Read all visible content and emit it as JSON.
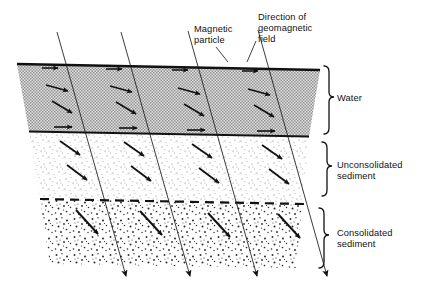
{
  "figure": {
    "type": "cross-section-diagram"
  },
  "callouts": [
    {
      "id": "magnetic-particle",
      "text": "Magnetic\nparticle"
    },
    {
      "id": "geomagnetic-field",
      "text": "Direction of\ngeomagnetic\nfield"
    }
  ],
  "layers": [
    {
      "id": "water",
      "label": "Water",
      "texture": "halftone-gray",
      "fill": "#b9b9b9",
      "particle_orientation": "random-to-aligning"
    },
    {
      "id": "unconsolidated-sediment",
      "label": "Unconsolidated\nsediment",
      "texture": "fine-stipple",
      "fill": "#f2f2f2",
      "particle_orientation": "aligned-with-field"
    },
    {
      "id": "consolidated-sediment",
      "label": "Consolidated\nsediment",
      "texture": "coarse-stipple",
      "fill": "#f6f6f6",
      "particle_orientation": "locked-aligned"
    }
  ],
  "field_lines": {
    "count": 4,
    "description": "Inclined geomagnetic field lines with downward arrowheads",
    "color": "#1a1a1a"
  },
  "colors": {
    "ink": "#111111",
    "water_fill": "#b9b9b9",
    "sediment_fill": "#f2f2f2",
    "consolidated_fill": "#f6f6f6",
    "background": "#ffffff"
  }
}
